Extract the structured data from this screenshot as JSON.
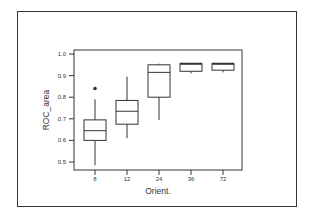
{
  "chart_data": {
    "type": "boxplot",
    "title": "",
    "xlabel": "Orient.",
    "ylabel": "ROC_area",
    "categories": [
      "8",
      "12",
      "24",
      "36",
      "72"
    ],
    "ylim": [
      0.47,
      1.0
    ],
    "yticks": [
      0.5,
      0.6,
      0.7,
      0.8,
      0.9,
      1.0
    ],
    "ytick_labels": [
      "0.5",
      "0.6",
      "0.7",
      "0.8",
      "0.9",
      "1.0"
    ],
    "grid": false,
    "legend": null,
    "boxes": [
      {
        "category": "8",
        "whisker_low": 0.485,
        "q1": 0.6,
        "median": 0.645,
        "q3": 0.695,
        "whisker_high": 0.79,
        "outliers": [
          0.84
        ]
      },
      {
        "category": "12",
        "whisker_low": 0.61,
        "q1": 0.675,
        "median": 0.735,
        "q3": 0.785,
        "whisker_high": 0.895,
        "outliers": []
      },
      {
        "category": "24",
        "whisker_low": 0.695,
        "q1": 0.8,
        "median": 0.915,
        "q3": 0.95,
        "whisker_high": 0.955,
        "outliers": []
      },
      {
        "category": "36",
        "whisker_low": 0.91,
        "q1": 0.92,
        "median": 0.955,
        "q3": 0.955,
        "whisker_high": 0.955,
        "outliers": []
      },
      {
        "category": "72",
        "whisker_low": 0.915,
        "q1": 0.925,
        "median": 0.955,
        "q3": 0.955,
        "whisker_high": 0.955,
        "outliers": []
      }
    ]
  },
  "colors": {
    "line": "#333333",
    "background": "#ffffff"
  }
}
